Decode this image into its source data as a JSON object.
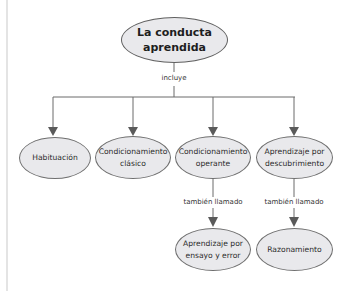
{
  "diagram": {
    "root": {
      "text": "La conducta\naprendida"
    },
    "root_edge_label": "incluye",
    "children": [
      {
        "text": "Habituación"
      },
      {
        "text": "Condicionamiento\nclásico"
      },
      {
        "text": "Condicionamiento\noperante",
        "edge_label": "también llamado",
        "child": {
          "text": "Aprendizaje por\nensayo y error"
        }
      },
      {
        "text": "Aprendizaje por\ndescubrimiento",
        "edge_label": "también llamado",
        "child": {
          "text": "Razonamiento"
        }
      }
    ]
  },
  "colors": {
    "node_fill": "#e9e9ec",
    "node_border": "#6f6f6f",
    "line": "#6a6a6a",
    "arrow": "#5a5a5a"
  }
}
